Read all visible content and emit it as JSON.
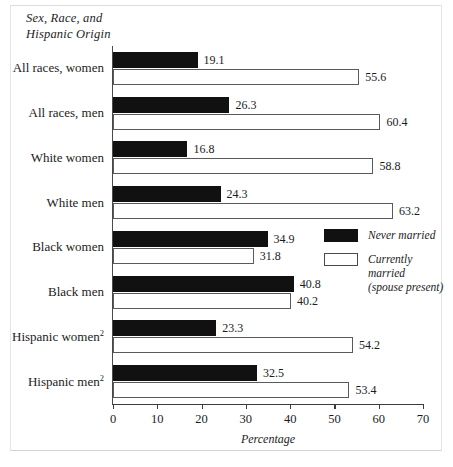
{
  "figure": {
    "axis_title_lines": [
      "Sex, Race, and",
      "Hispanic Origin"
    ],
    "x_axis_name": "Percentage"
  },
  "legend": {
    "items": [
      {
        "key": "never",
        "label": "Never married",
        "sublabel": ""
      },
      {
        "key": "current",
        "label": "Currently married",
        "sublabel": "(spouse present)"
      }
    ]
  },
  "chart_data": {
    "type": "bar",
    "orientation": "horizontal",
    "title": "Sex, Race, and Hispanic Origin",
    "xlabel": "Percentage",
    "ylabel": "Sex, Race, and Hispanic Origin",
    "xlim": [
      0,
      70
    ],
    "xticks": [
      0,
      10,
      20,
      30,
      40,
      50,
      60,
      70
    ],
    "grid": false,
    "legend_position": "right-middle",
    "categories": [
      "All races, women",
      "All races, men",
      "White women",
      "White men",
      "Black women",
      "Black men",
      "Hispanic women",
      "Hispanic men"
    ],
    "category_footnotes": [
      "",
      "",
      "",
      "",
      "",
      "",
      "2",
      "2"
    ],
    "series": [
      {
        "name": "Never married",
        "color": "#111111",
        "values": [
          19.1,
          26.3,
          16.8,
          24.3,
          34.9,
          40.8,
          23.3,
          32.5
        ]
      },
      {
        "name": "Currently married (spouse present)",
        "color": "#ffffff",
        "values": [
          55.6,
          60.4,
          58.8,
          63.2,
          31.8,
          40.2,
          54.2,
          53.4
        ]
      }
    ]
  }
}
